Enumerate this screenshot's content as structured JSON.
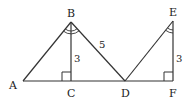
{
  "diagram": {
    "points": {
      "A": {
        "label": "A",
        "x": 23,
        "y": 81
      },
      "B": {
        "label": "B",
        "x": 71,
        "y": 22
      },
      "C": {
        "label": "C",
        "x": 71,
        "y": 81
      },
      "D": {
        "label": "D",
        "x": 125,
        "y": 81
      },
      "E": {
        "label": "E",
        "x": 173,
        "y": 21
      },
      "F": {
        "label": "F",
        "x": 173,
        "y": 81
      }
    },
    "measures": {
      "BC": "3",
      "BD": "5",
      "EF": "3"
    },
    "line_color": "#333333"
  }
}
